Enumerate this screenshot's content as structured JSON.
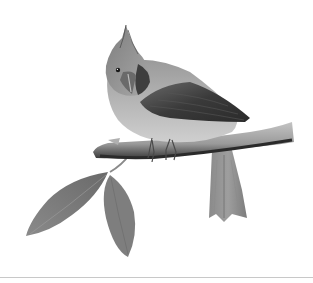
{
  "image": {
    "subject": "crested bird perched on a branch",
    "style": "grayscale illustration",
    "width": 313,
    "height": 283
  },
  "palette": {
    "background": "#ffffff",
    "divider": "#c8c8c8",
    "body_light": "#b8b8b8",
    "body_mid": "#8e8e8e",
    "wing_dark": "#3a3a3a",
    "branch": "#9a9a9a",
    "branch_shadow": "#2e2e2e",
    "leaf": "#7a7a7a",
    "tail": "#858585"
  }
}
